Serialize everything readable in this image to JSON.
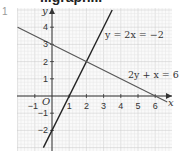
{
  "header": {
    "heading_fragment": "...graph...",
    "question_number": "1"
  },
  "chart_data": {
    "type": "line",
    "title": "",
    "xlabel": "x",
    "ylabel": "y",
    "origin_label": "O",
    "xlim": [
      -2,
      6.7
    ],
    "ylim": [
      -3,
      4.7
    ],
    "grid": true,
    "x_ticks": [
      "-1",
      "1",
      "2",
      "3",
      "4",
      "5",
      "6"
    ],
    "y_ticks": [
      "4",
      "3",
      "2",
      "1",
      "-1",
      "-2"
    ],
    "series": [
      {
        "name": "y = 2x = −2",
        "label": "y = 2x = −2",
        "points": [
          [
            -0.5,
            -3
          ],
          [
            3.5,
            5
          ]
        ],
        "intercepts": {
          "x": 1,
          "y": -2
        },
        "color": "#222222"
      },
      {
        "name": "2y + x = 6",
        "label": "2y + x = 6",
        "points": [
          [
            -2,
            4
          ],
          [
            6.7,
            -0.35
          ]
        ],
        "intercepts": {
          "x": 6,
          "y": 3
        },
        "color": "#555555"
      }
    ],
    "intersection": [
      2,
      2
    ]
  }
}
